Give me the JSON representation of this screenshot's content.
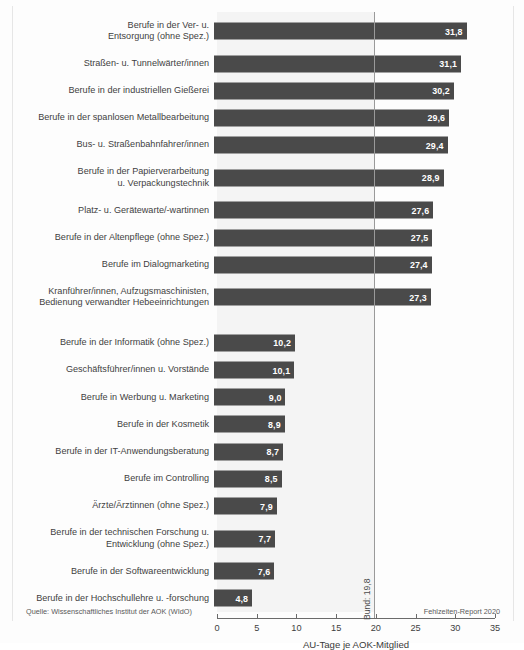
{
  "chart_data": {
    "type": "bar",
    "orientation": "horizontal",
    "title": "",
    "xlabel": "AU-Tage je AOK-Mitglied",
    "ylabel": "",
    "xlim": [
      0,
      35
    ],
    "xticks": [
      "0",
      "5",
      "10",
      "15",
      "20",
      "25",
      "30",
      "35"
    ],
    "xtick_values": [
      0,
      5,
      10,
      15,
      20,
      25,
      30,
      35
    ],
    "grid": false,
    "legend": "none",
    "bar_color": "#4a4a4a",
    "value_label_color": "#ffffff",
    "plot_band_color": "#f4f4f4",
    "groups": [
      {
        "name": "hoechste-au-tage",
        "categories": [
          "Berufe in der Ver- u.\nEntsorgung (ohne Spez.)",
          "Straßen- u. Tunnelwärter/innen",
          "Berufe in der industriellen Gießerei",
          "Berufe in der spanlosen Metallbearbeitung",
          "Bus- u. Straßenbahnfahrer/innen",
          "Berufe in der Papierverarbeitung\nu. Verpackungstechnik",
          "Platz- u. Gerätewarte/-wartinnen",
          "Berufe in der Altenpflege (ohne Spez.)",
          "Berufe im Dialogmarketing",
          "Kranführer/innen, Aufzugsmaschinisten,\nBedienung verwandter Hebeeinrichtungen"
        ],
        "values": [
          31.8,
          31.1,
          30.2,
          29.6,
          29.4,
          28.9,
          27.6,
          27.5,
          27.4,
          27.3
        ],
        "value_labels": [
          "31,8",
          "31,1",
          "30,2",
          "29,6",
          "29,4",
          "28,9",
          "27,6",
          "27,5",
          "27,4",
          "27,3"
        ],
        "multiline": [
          true,
          false,
          false,
          false,
          false,
          true,
          false,
          false,
          false,
          true
        ]
      },
      {
        "name": "niedrigste-au-tage",
        "categories": [
          "Berufe in der Informatik (ohne Spez.)",
          "Geschäftsführer/innen u. Vorstände",
          "Berufe in Werbung u. Marketing",
          "Berufe in der Kosmetik",
          "Berufe in der IT-Anwendungsberatung",
          "Berufe im Controlling",
          "Ärzte/Ärztinnen (ohne Spez.)",
          "Berufe in der technischen Forschung u.\nEntwicklung (ohne Spez.)",
          "Berufe in der Softwareentwicklung",
          "Berufe in der Hochschullehre u. -forschung"
        ],
        "values": [
          10.2,
          10.1,
          9.0,
          8.9,
          8.7,
          8.5,
          7.9,
          7.7,
          7.6,
          4.8
        ],
        "value_labels": [
          "10,2",
          "10,1",
          "9,0",
          "8,9",
          "8,7",
          "8,5",
          "7,9",
          "7,7",
          "7,6",
          "4,8"
        ],
        "multiline": [
          false,
          false,
          false,
          false,
          false,
          false,
          false,
          true,
          false,
          false
        ]
      }
    ],
    "reference_line": {
      "label": "Bund: 19,8",
      "value": 19.8,
      "color": "#9a9a9a"
    }
  },
  "footer": {
    "source": "Quelle: Wissenschaftliches Institut der AOK (WIdO)",
    "report": "Fehlzeiten-Report 2020"
  }
}
